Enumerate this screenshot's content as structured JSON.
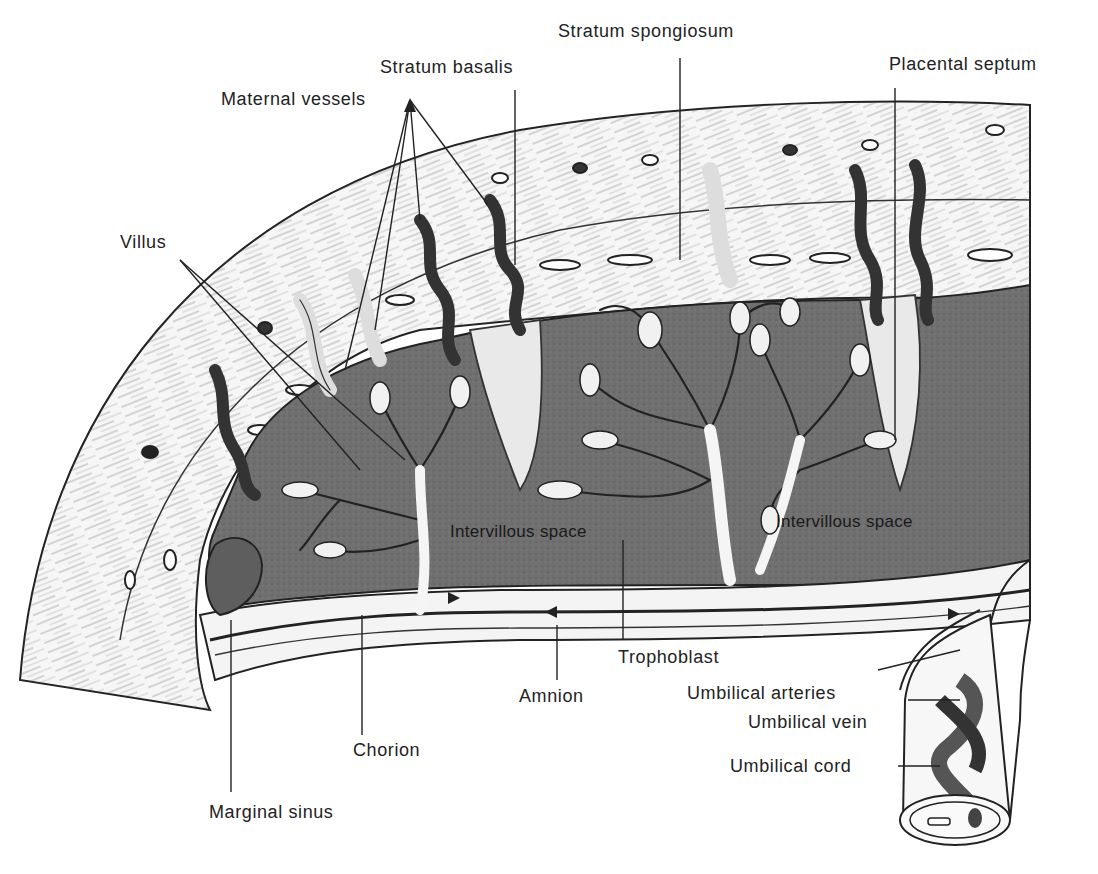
{
  "figure": {
    "labels": {
      "stratum_spongiosum": "Stratum spongiosum",
      "stratum_basalis": "Stratum basalis",
      "maternal_vessels": "Maternal vessels",
      "placental_septum": "Placental septum",
      "villus": "Villus",
      "intervillous_space_left": "Intervillous space",
      "intervillous_space_right": "Intervillous space",
      "trophoblast": "Trophoblast",
      "amnion": "Amnion",
      "chorion": "Chorion",
      "marginal_sinus": "Marginal sinus",
      "umbilical_arteries": "Umbilical arteries",
      "umbilical_vein": "Umbilical vein",
      "umbilical_cord": "Umbilical cord"
    },
    "colors": {
      "ink": "#222222",
      "blood_space": "#6e6e6e",
      "vessel": "#3a3a3a",
      "tissue": "#f2f2f2",
      "background": "#ffffff"
    }
  }
}
